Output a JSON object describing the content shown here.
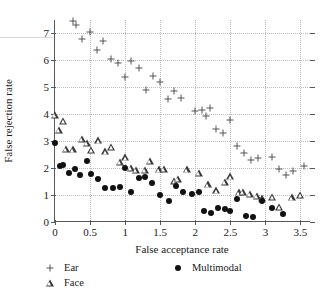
{
  "chart_data": {
    "type": "scatter",
    "title": "",
    "xlabel": "False acceptance rate",
    "ylabel": "False rejection rate",
    "xlim": [
      0,
      3.65
    ],
    "ylim": [
      0,
      7.5
    ],
    "xticks": [
      "0",
      "0.5",
      "1",
      "1.5",
      "2",
      "2.5",
      "3",
      "3.5"
    ],
    "xtick_values": [
      0,
      0.5,
      1,
      1.5,
      2,
      2.5,
      3,
      3.5
    ],
    "yticks": [
      "0",
      "1",
      "2",
      "3",
      "4",
      "5",
      "6",
      "7"
    ],
    "ytick_values": [
      0,
      1,
      2,
      3,
      4,
      5,
      6,
      7
    ],
    "grid": true,
    "legend_position": "below",
    "series": [
      {
        "name": "Ear",
        "marker": "plus",
        "color": "#555555",
        "points": [
          [
            0.25,
            7.45
          ],
          [
            0.3,
            7.3
          ],
          [
            0.39,
            6.8
          ],
          [
            0.5,
            7.05
          ],
          [
            0.6,
            6.37
          ],
          [
            0.69,
            6.73
          ],
          [
            0.8,
            6.05
          ],
          [
            0.9,
            5.9
          ],
          [
            1.0,
            5.38
          ],
          [
            1.08,
            5.97
          ],
          [
            1.2,
            5.7
          ],
          [
            1.3,
            4.9
          ],
          [
            1.4,
            5.42
          ],
          [
            1.5,
            5.18
          ],
          [
            1.61,
            4.57
          ],
          [
            1.7,
            4.88
          ],
          [
            1.79,
            4.6
          ],
          [
            2.0,
            4.13
          ],
          [
            2.1,
            4.17
          ],
          [
            2.15,
            3.95
          ],
          [
            2.21,
            4.22
          ],
          [
            2.3,
            3.47
          ],
          [
            2.4,
            3.3
          ],
          [
            2.5,
            3.78
          ],
          [
            2.6,
            2.82
          ],
          [
            2.7,
            2.58
          ],
          [
            2.8,
            2.3
          ],
          [
            2.9,
            2.38
          ],
          [
            3.1,
            2.4
          ],
          [
            3.2,
            1.97
          ],
          [
            3.3,
            1.75
          ],
          [
            3.39,
            1.9
          ],
          [
            3.55,
            2.08
          ]
        ]
      },
      {
        "name": "Face",
        "marker": "triangle",
        "color": "#3a3a3a",
        "points": [
          [
            0.0,
            3.97
          ],
          [
            0.05,
            3.42
          ],
          [
            0.12,
            3.75
          ],
          [
            0.15,
            2.72
          ],
          [
            0.25,
            2.7
          ],
          [
            0.38,
            3.08
          ],
          [
            0.45,
            2.95
          ],
          [
            0.52,
            2.67
          ],
          [
            0.62,
            3.03
          ],
          [
            0.72,
            2.62
          ],
          [
            0.8,
            2.78
          ],
          [
            0.92,
            2.23
          ],
          [
            1.0,
            2.4
          ],
          [
            1.08,
            2.0
          ],
          [
            1.15,
            1.93
          ],
          [
            1.28,
            1.93
          ],
          [
            1.35,
            2.28
          ],
          [
            1.48,
            1.95
          ],
          [
            1.55,
            1.97
          ],
          [
            1.7,
            1.52
          ],
          [
            1.75,
            1.6
          ],
          [
            1.88,
            1.95
          ],
          [
            2.05,
            1.82
          ],
          [
            2.18,
            1.4
          ],
          [
            2.3,
            1.18
          ],
          [
            2.42,
            1.48
          ],
          [
            2.5,
            1.7
          ],
          [
            2.62,
            1.1
          ],
          [
            2.68,
            1.12
          ],
          [
            2.78,
            1.05
          ],
          [
            2.88,
            0.98
          ],
          [
            2.95,
            0.88
          ],
          [
            3.1,
            0.93
          ],
          [
            3.2,
            0.55
          ],
          [
            3.38,
            0.92
          ],
          [
            3.5,
            1.0
          ]
        ]
      },
      {
        "name": "Multimodal",
        "marker": "filled-circle",
        "color": "#111111",
        "points": [
          [
            0.0,
            2.93
          ],
          [
            0.07,
            2.08
          ],
          [
            0.12,
            2.1
          ],
          [
            0.2,
            1.83
          ],
          [
            0.28,
            1.98
          ],
          [
            0.35,
            1.73
          ],
          [
            0.45,
            2.27
          ],
          [
            0.52,
            1.78
          ],
          [
            0.62,
            1.6
          ],
          [
            0.72,
            1.25
          ],
          [
            0.82,
            1.27
          ],
          [
            0.92,
            1.3
          ],
          [
            1.0,
            2.02
          ],
          [
            1.08,
            1.13
          ],
          [
            1.2,
            1.62
          ],
          [
            1.28,
            1.67
          ],
          [
            1.38,
            1.45
          ],
          [
            1.5,
            1.02
          ],
          [
            1.62,
            0.78
          ],
          [
            1.72,
            1.35
          ],
          [
            1.82,
            1.13
          ],
          [
            1.95,
            1.05
          ],
          [
            2.05,
            1.1
          ],
          [
            2.12,
            0.42
          ],
          [
            2.22,
            0.32
          ],
          [
            2.32,
            0.52
          ],
          [
            2.42,
            0.47
          ],
          [
            2.5,
            0.42
          ],
          [
            2.6,
            0.87
          ],
          [
            2.72,
            0.22
          ],
          [
            2.82,
            0.17
          ],
          [
            2.95,
            0.77
          ],
          [
            3.1,
            0.53
          ],
          [
            3.25,
            0.28
          ]
        ]
      }
    ]
  },
  "legend": {
    "entries": [
      {
        "label": "Ear",
        "marker": "plus"
      },
      {
        "label": "Face",
        "marker": "triangle"
      },
      {
        "label": "Multimodal",
        "marker": "filled-circle"
      }
    ]
  }
}
